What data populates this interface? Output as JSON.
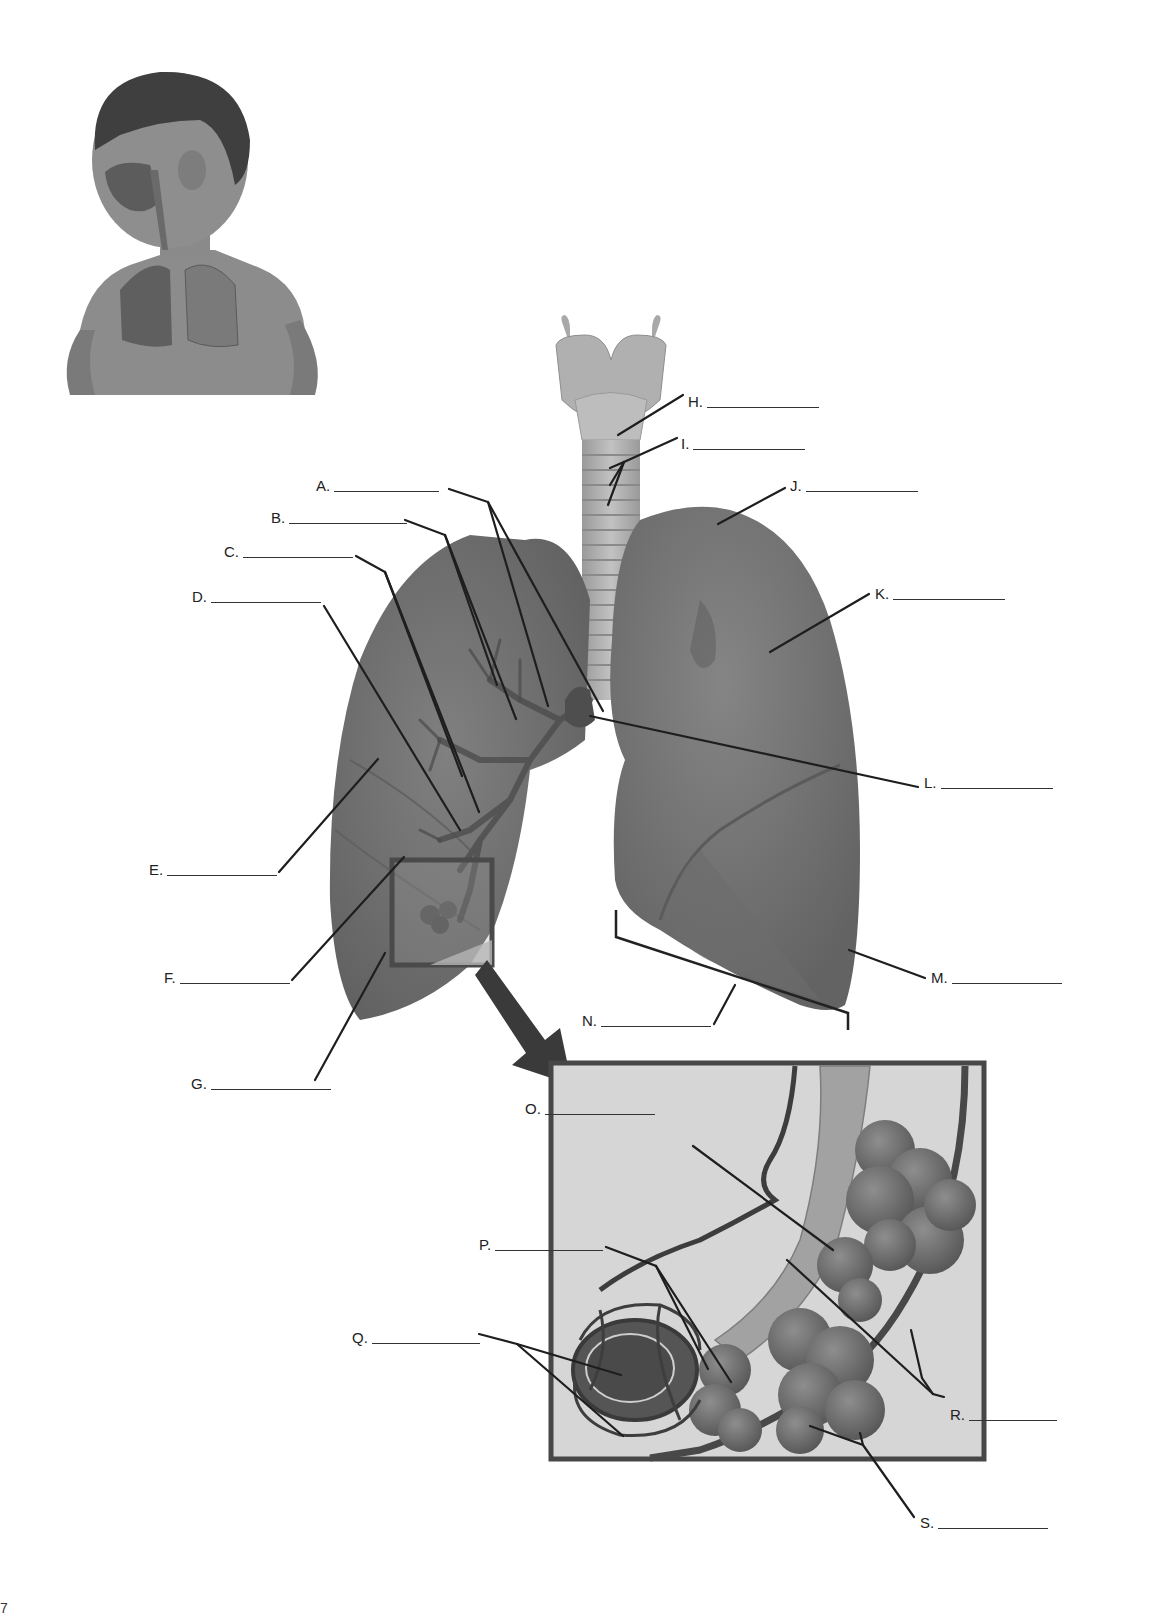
{
  "worksheet": {
    "subject": "Respiratory system labeling diagram",
    "inset_image": "child-respiratory-system",
    "corner_mark": "7"
  },
  "labels": [
    {
      "id": "A",
      "letter": "A.",
      "x": 316,
      "y": 478,
      "blank": 105
    },
    {
      "id": "B",
      "letter": "B.",
      "x": 271,
      "y": 510,
      "blank": 118
    },
    {
      "id": "C",
      "letter": "C.",
      "x": 224,
      "y": 544,
      "blank": 110
    },
    {
      "id": "D",
      "letter": "D.",
      "x": 192,
      "y": 589,
      "blank": 110
    },
    {
      "id": "E",
      "letter": "E.",
      "x": 149,
      "y": 862,
      "blank": 110
    },
    {
      "id": "F",
      "letter": "F.",
      "x": 164,
      "y": 970,
      "blank": 110
    },
    {
      "id": "G",
      "letter": "G.",
      "x": 191,
      "y": 1076,
      "blank": 120
    },
    {
      "id": "H",
      "letter": "H.",
      "x": 688,
      "y": 394,
      "blank": 112
    },
    {
      "id": "I",
      "letter": "I.",
      "x": 681,
      "y": 436,
      "blank": 112
    },
    {
      "id": "J",
      "letter": "J.",
      "x": 790,
      "y": 478,
      "blank": 112
    },
    {
      "id": "K",
      "letter": "K.",
      "x": 875,
      "y": 586,
      "blank": 112
    },
    {
      "id": "L",
      "letter": "L.",
      "x": 924,
      "y": 775,
      "blank": 112
    },
    {
      "id": "M",
      "letter": "M.",
      "x": 931,
      "y": 970,
      "blank": 110
    },
    {
      "id": "N",
      "letter": "N.",
      "x": 582,
      "y": 1013,
      "blank": 110
    },
    {
      "id": "O",
      "letter": "O.",
      "x": 525,
      "y": 1101,
      "blank": 110
    },
    {
      "id": "P",
      "letter": "P.",
      "x": 479,
      "y": 1237,
      "blank": 108
    },
    {
      "id": "Q",
      "letter": "Q.",
      "x": 352,
      "y": 1330,
      "blank": 108
    },
    {
      "id": "R",
      "letter": "R.",
      "x": 950,
      "y": 1407,
      "blank": 88
    },
    {
      "id": "S",
      "letter": "S.",
      "x": 920,
      "y": 1515,
      "blank": 110
    }
  ],
  "colors": {
    "lung_fill": "#6e6e6e",
    "lung_dark": "#5a5a5a",
    "trachea_fill": "#b9b9b9",
    "inset_bg": "#d4d4d4",
    "inset_border": "#4a4a4a",
    "leader_line": "#1e1e1e",
    "alveoli": "#6a6a6a",
    "skin": "#8a8a8a",
    "hair": "#3e3e3e"
  }
}
